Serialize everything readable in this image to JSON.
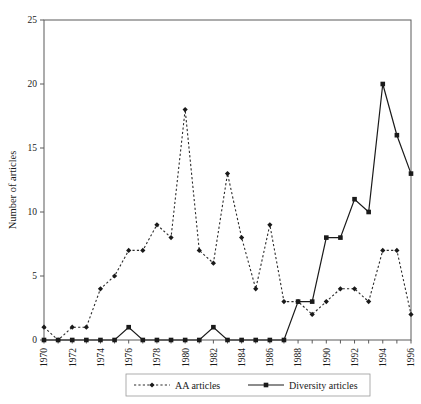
{
  "chart_data": {
    "type": "line",
    "title": "",
    "xlabel": "",
    "ylabel": "Number of articles",
    "xlim": [
      1970,
      1996
    ],
    "ylim": [
      0,
      25
    ],
    "grid": false,
    "legend_position": "bottom",
    "x": [
      1970,
      1971,
      1972,
      1973,
      1974,
      1975,
      1976,
      1977,
      1978,
      1979,
      1980,
      1981,
      1982,
      1983,
      1984,
      1985,
      1986,
      1987,
      1988,
      1989,
      1990,
      1991,
      1992,
      1993,
      1994,
      1995,
      1996
    ],
    "xticks": [
      "1970",
      "1972",
      "1974",
      "1976",
      "1978",
      "1980",
      "1982",
      "1984",
      "1986",
      "1988",
      "1990",
      "1992",
      "1994",
      "1996"
    ],
    "yticks": [
      "0",
      "5",
      "10",
      "15",
      "20",
      "25"
    ],
    "series": [
      {
        "name": "AA articles",
        "marker": "diamond",
        "linestyle": "dotted",
        "color": "#2b2b2b",
        "values": [
          1,
          0,
          1,
          1,
          4,
          5,
          7,
          7,
          9,
          8,
          18,
          7,
          6,
          13,
          8,
          4,
          9,
          3,
          3,
          2,
          3,
          4,
          4,
          3,
          7,
          7,
          2
        ]
      },
      {
        "name": "Diversity articles",
        "marker": "square",
        "linestyle": "solid",
        "color": "#1a1a1a",
        "values": [
          0,
          0,
          0,
          0,
          0,
          0,
          1,
          0,
          0,
          0,
          0,
          0,
          1,
          0,
          0,
          0,
          0,
          0,
          3,
          3,
          8,
          8,
          11,
          10,
          20,
          16,
          13
        ]
      }
    ]
  },
  "axes": {
    "ylabel": "Number of articles"
  },
  "legend": {
    "items": [
      {
        "label": "AA articles"
      },
      {
        "label": "Diversity articles"
      }
    ]
  }
}
